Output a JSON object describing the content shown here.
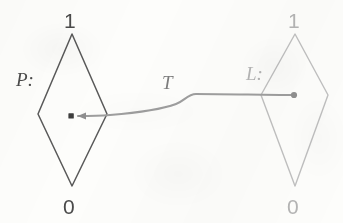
{
  "figure": {
    "kind": "state-transition-diagram",
    "background_color": "#fdfdfb",
    "width": 343,
    "height": 223,
    "nodes": [
      {
        "id": "P",
        "name_label": "P:",
        "top_label": "1",
        "bottom_label": "0",
        "shape": "diamond",
        "stroke_color": "#5a5a5a",
        "text_color": "#4a4a4a",
        "center_x": 72,
        "center_y": 114,
        "half_width": 35,
        "top_y": 34,
        "bottom_y": 186
      },
      {
        "id": "L",
        "name_label": "L:",
        "top_label": "1",
        "bottom_label": "0",
        "shape": "diamond",
        "stroke_color": "#bdbdbd",
        "text_color": "#b4b4b4",
        "center_x": 295,
        "center_y": 95,
        "half_width": 34,
        "top_y": 34,
        "bottom_y": 186
      }
    ],
    "edges": [
      {
        "id": "T",
        "label": "T",
        "label_color": "#6f6f6f",
        "stroke_color": "#9d9d9d",
        "from_node": "L",
        "to_node": "P",
        "direction": "right-to-left",
        "source_marker": "dot",
        "target_marker": "arrowhead-with-square-dot",
        "start_x": 295,
        "start_y": 95,
        "end_x": 71,
        "end_y": 116,
        "label_x": 168,
        "label_y": 81
      }
    ]
  }
}
